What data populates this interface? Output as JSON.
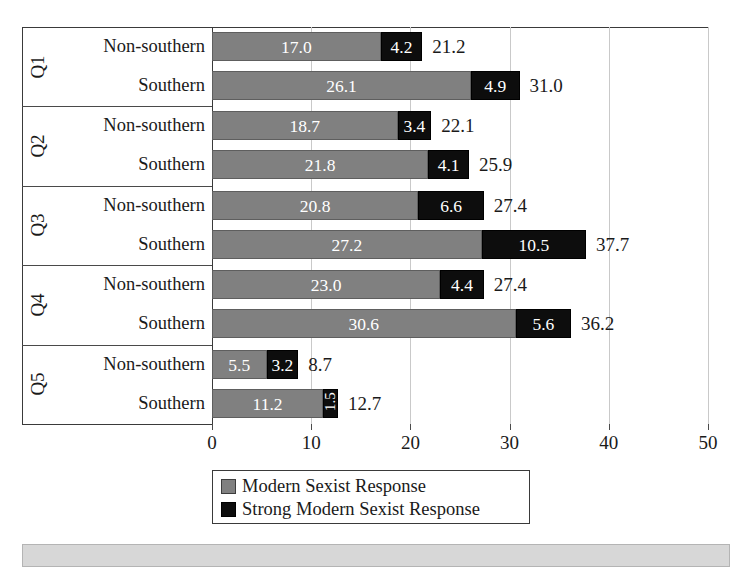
{
  "chart_data": {
    "type": "bar",
    "orientation": "horizontal",
    "stacked": true,
    "title": "",
    "subtitle": "",
    "xlabel": "",
    "ylabel": "",
    "xlim": [
      0,
      50
    ],
    "xticks": [
      0,
      10,
      20,
      30,
      40,
      50
    ],
    "xtick_labels": [
      "0",
      "10",
      "20",
      "30",
      "40",
      "50"
    ],
    "grid": true,
    "grid_axis": "x",
    "legend_position": "bottom-center",
    "series": [
      {
        "name": "Modern Sexist Response",
        "color": "#808080",
        "values": [
          17.0,
          26.1,
          18.7,
          21.8,
          20.8,
          27.2,
          23.0,
          30.6,
          5.5,
          11.2
        ]
      },
      {
        "name": "Strong Modern Sexist Response",
        "color": "#0d0d0d",
        "values": [
          4.2,
          4.9,
          3.4,
          4.1,
          6.6,
          10.5,
          4.4,
          5.6,
          3.2,
          1.5
        ]
      }
    ],
    "categories": [
      "Q1 Non-southern",
      "Q1 Southern",
      "Q2 Non-southern",
      "Q2 Southern",
      "Q3 Non-southern",
      "Q3 Southern",
      "Q4 Non-southern",
      "Q4 Southern",
      "Q5 Non-southern",
      "Q5 Southern"
    ],
    "totals": [
      21.2,
      31.0,
      22.1,
      25.9,
      27.4,
      37.7,
      27.4,
      36.2,
      8.7,
      12.7
    ],
    "groups": [
      {
        "label": "Q1",
        "rows": [
          {
            "label": "Non-southern",
            "modern": "17.0",
            "strong": "4.2",
            "total": "21.2"
          },
          {
            "label": "Southern",
            "modern": "26.1",
            "strong": "4.9",
            "total": "31.0"
          }
        ]
      },
      {
        "label": "Q2",
        "rows": [
          {
            "label": "Non-southern",
            "modern": "18.7",
            "strong": "3.4",
            "total": "22.1"
          },
          {
            "label": "Southern",
            "modern": "21.8",
            "strong": "4.1",
            "total": "25.9"
          }
        ]
      },
      {
        "label": "Q3",
        "rows": [
          {
            "label": "Non-southern",
            "modern": "20.8",
            "strong": "6.6",
            "total": "27.4"
          },
          {
            "label": "Southern",
            "modern": "27.2",
            "strong": "10.5",
            "total": "37.7"
          }
        ]
      },
      {
        "label": "Q4",
        "rows": [
          {
            "label": "Non-southern",
            "modern": "23.0",
            "strong": "4.4",
            "total": "27.4"
          },
          {
            "label": "Southern",
            "modern": "30.6",
            "strong": "5.6",
            "total": "36.2"
          }
        ]
      },
      {
        "label": "Q5",
        "rows": [
          {
            "label": "Non-southern",
            "modern": "5.5",
            "strong": "3.2",
            "total": "8.7"
          },
          {
            "label": "Southern",
            "modern": "11.2",
            "strong": "1.5",
            "total": "12.7"
          }
        ]
      }
    ],
    "legend": [
      {
        "label": "Modern Sexist Response",
        "color": "#808080"
      },
      {
        "label": "Strong Modern Sexist Response",
        "color": "#0d0d0d"
      }
    ]
  }
}
